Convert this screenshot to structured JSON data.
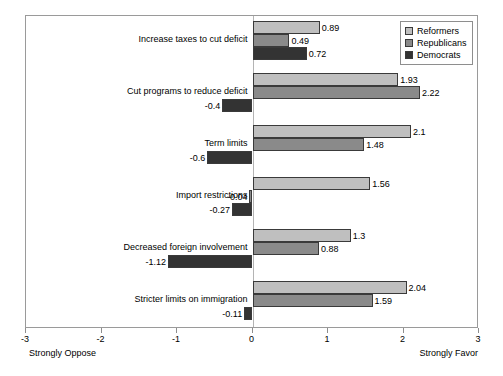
{
  "chart_data": {
    "type": "bar",
    "orientation": "horizontal",
    "title": "",
    "xlabel": "",
    "ylabel": "",
    "xlim": [
      -3,
      3
    ],
    "xticks": [
      -3,
      -2,
      -1,
      0,
      1,
      2,
      3
    ],
    "xtick_labels": [
      "-3",
      "-2",
      "-1",
      "0",
      "1",
      "2",
      "3"
    ],
    "grid": false,
    "legend_position": "top-right",
    "axis_anchor_left": "Strongly Oppose",
    "axis_anchor_right": "Strongly Favor",
    "categories": [
      "Increase taxes to cut deficit",
      "Cut programs to reduce deficit",
      "Term limits",
      "Import restrictions",
      "Decreased foreign involvement",
      "Stricter limits on immigration"
    ],
    "series": [
      {
        "name": "Reformers",
        "color": "#bfbfbf",
        "values": [
          0.89,
          1.93,
          2.1,
          1.56,
          1.3,
          2.04
        ],
        "labels": [
          "0.89",
          "1.93",
          "2.1",
          "1.56",
          "1.3",
          "2.04"
        ]
      },
      {
        "name": "Republicans",
        "color": "#8a8a8a",
        "values": [
          0.49,
          2.22,
          1.48,
          -0.04,
          0.88,
          1.59
        ],
        "labels": [
          "0.49",
          "2.22",
          "1.48",
          "-0.04",
          "0.88",
          "1.59"
        ]
      },
      {
        "name": "Democrats",
        "color": "#333333",
        "values": [
          0.72,
          -0.4,
          -0.6,
          -0.27,
          -1.12,
          -0.11
        ],
        "labels": [
          "0.72",
          "-0.4",
          "-0.6",
          "-0.27",
          "-1.12",
          "-0.11"
        ]
      }
    ]
  },
  "legend": {
    "items": [
      {
        "label": "Reformers"
      },
      {
        "label": "Republicans"
      },
      {
        "label": "Democrats"
      }
    ]
  }
}
